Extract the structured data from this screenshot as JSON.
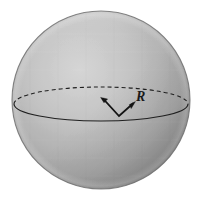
{
  "figure": {
    "name": "shaded-sphere-with-radius",
    "type": "geometric-diagram",
    "background_color": "#ffffff",
    "canvas": {
      "width": 202,
      "height": 203
    }
  },
  "sphere": {
    "name": "sphere",
    "center": {
      "x": 101,
      "y": 100
    },
    "radius": 89,
    "outline_color": "#6e6e6e",
    "highlight_color": "#cfcfcf",
    "midtone_color": "#a8a8a8",
    "shadow_color": "#757575",
    "rim_color": "#9a9a9a"
  },
  "equator": {
    "name": "equator-ellipse",
    "center": {
      "x": 101,
      "y": 104
    },
    "semi_axis_x": 87,
    "semi_axis_y": 17,
    "front_arc_style": "solid",
    "back_arc_style": "dashed",
    "dash_pattern": "4 3",
    "line_color": "#1f1f1f",
    "line_width": 1.1
  },
  "radius_arrow": {
    "name": "radius-arrow",
    "label": "R",
    "label_position": {
      "x": 136,
      "y": 101
    },
    "center_tip": {
      "x": 102,
      "y": 98
    },
    "vertex": {
      "x": 119,
      "y": 116
    },
    "surface_tip": {
      "x": 134,
      "y": 103
    },
    "line_color": "#141414",
    "line_width": 1.6,
    "arrowheads": 2
  }
}
